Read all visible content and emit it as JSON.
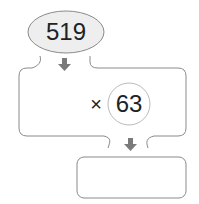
{
  "diagram": {
    "input_value": "519",
    "operator": "×",
    "multiplier": "63",
    "result": "",
    "colors": {
      "outline": "#8a8a8a",
      "ellipse_fill": "#eeeeee",
      "arrow": "#7a7a7a",
      "text": "#222222"
    }
  }
}
